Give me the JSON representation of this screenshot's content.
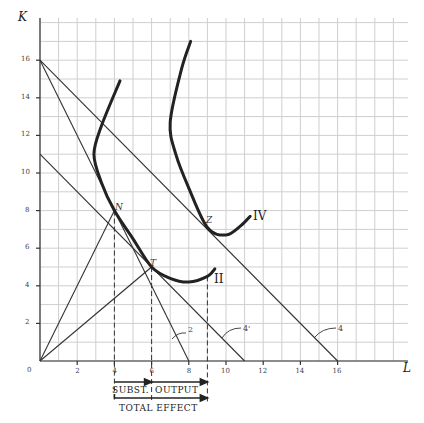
{
  "chart_data": {
    "type": "line",
    "title": "",
    "xlabel": "L",
    "ylabel": "K",
    "xlim": [
      0,
      20
    ],
    "ylim": [
      0,
      18
    ],
    "grid": true,
    "x_ticks": [
      "0",
      "2",
      "4",
      "6",
      "8",
      "10",
      "12",
      "14",
      "16"
    ],
    "y_ticks": [
      "2",
      "4",
      "6",
      "8",
      "10",
      "12",
      "14",
      "16"
    ],
    "budget_lines": [
      {
        "name": "2",
        "from": [
          0,
          16
        ],
        "to": [
          8,
          0
        ]
      },
      {
        "name": "4'",
        "from": [
          0,
          11
        ],
        "to": [
          11,
          0
        ]
      },
      {
        "name": "4",
        "from": [
          0,
          16
        ],
        "to": [
          16,
          0
        ]
      }
    ],
    "rays": [
      {
        "name": "ray-N",
        "from": [
          0,
          0
        ],
        "to": [
          4,
          8
        ]
      },
      {
        "name": "ray-T",
        "from": [
          0,
          0
        ],
        "to": [
          6,
          5
        ]
      }
    ],
    "isoquants": [
      {
        "name": "II",
        "points": [
          [
            4.3,
            14.9
          ],
          [
            3.3,
            12.5
          ],
          [
            2.9,
            11
          ],
          [
            3.3,
            9.5
          ],
          [
            4,
            8
          ],
          [
            5,
            6.5
          ],
          [
            6,
            5
          ],
          [
            7,
            4.4
          ],
          [
            8,
            4.2
          ],
          [
            9,
            4.5
          ],
          [
            9.4,
            4.9
          ]
        ]
      },
      {
        "name": "IV",
        "points": [
          [
            8.1,
            17.0
          ],
          [
            7.6,
            15.5
          ],
          [
            7,
            12.7
          ],
          [
            7.3,
            11
          ],
          [
            8,
            9.2
          ],
          [
            9,
            7.1
          ],
          [
            10,
            6.7
          ],
          [
            10.8,
            7.2
          ],
          [
            11.3,
            7.7
          ]
        ]
      }
    ],
    "points": [
      {
        "label": "N",
        "x": 4,
        "y": 8
      },
      {
        "label": "T",
        "x": 6,
        "y": 5
      },
      {
        "label": "Z",
        "x": 9,
        "y": 7.1
      }
    ],
    "dashed_verticals": [
      4,
      6,
      9
    ],
    "annotations": [
      "SUBST.",
      "OUTPUT",
      "TOTAL EFFECT"
    ]
  },
  "labels": {
    "x_axis": "L",
    "y_axis": "K",
    "origin": "0",
    "point_n": "N",
    "point_t": "T",
    "point_z": "Z",
    "isoquant_ii": "II",
    "isoquant_iv": "IV",
    "line_2": "2",
    "line_4p": "4'",
    "line_4": "4",
    "subst": "SUBST.",
    "output": "OUTPUT",
    "total": "TOTAL EFFECT"
  },
  "ticks": {
    "x": [
      "2",
      "4",
      "6",
      "8",
      "10",
      "12",
      "14",
      "16"
    ],
    "y": [
      "2",
      "4",
      "6",
      "8",
      "10",
      "12",
      "14",
      "16"
    ]
  }
}
